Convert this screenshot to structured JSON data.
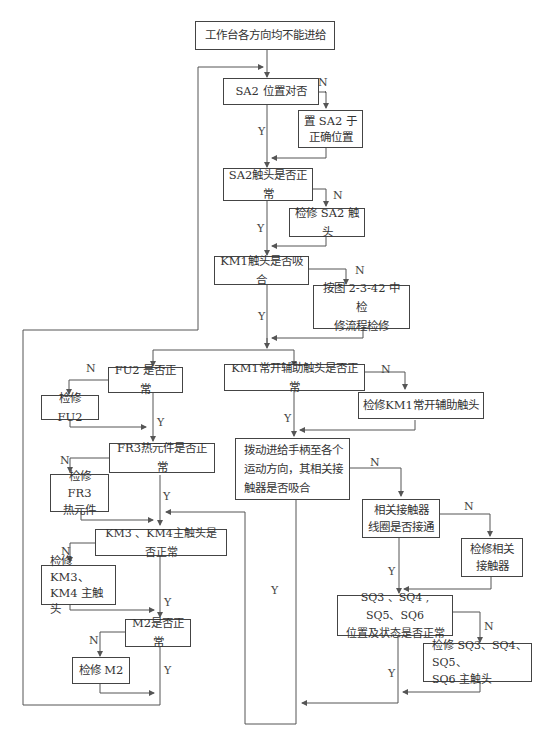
{
  "flowchart": {
    "nodes": {
      "start": "工作台各方向均不能进给",
      "sa2_position": "SA2 位置对否",
      "set_sa2": "置 SA2 于\n正确位置",
      "sa2_contact": "SA2触头是否正常",
      "repair_sa2": "检修 SA2 触头",
      "km1_contact": "KM1触头是否吸合",
      "per_fig": "按图 2-3-42 中检\n修流程检修",
      "fu2": "FU2 是否正常",
      "repair_fu2": "检修 FU2",
      "fr3": "FR3热元件是否正常",
      "repair_fr3": "检修 FR3\n热元件",
      "km34": "KM3 、KM4主触头是否正常",
      "repair_km34": "检修 KM3、\nKM4 主触头",
      "m2": "M2是否正常",
      "repair_m2": "检修 M2",
      "km1_aux": "KM1常开辅助触头是否正常",
      "repair_km1_aux": "检修KM1常开辅助触头",
      "handle": "拨动进给手柄至各个\n运动方向，其相关接\n触器是否吸合",
      "coil": "相关接触器\n线圈是否接通",
      "repair_contactor": "检修相关\n接触器",
      "sq": "SQ3 、SQ4 , SQ5、SQ6\n位置及状态是否正常",
      "repair_sq": "检修 SQ3、SQ4、SQ5、\nSQ6 主触头"
    },
    "labels": {
      "yes": "Y",
      "no": "N"
    },
    "colors": {
      "line": "#555555",
      "border": "#444444",
      "text": "#333333",
      "background": "#ffffff"
    }
  }
}
